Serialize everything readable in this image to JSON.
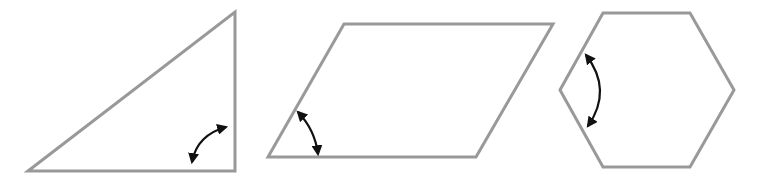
{
  "diagram": {
    "colors": {
      "shape_stroke": "#999999",
      "arrow": "#111111",
      "background": "#ffffff"
    },
    "shapes": [
      {
        "name": "right-triangle",
        "points": "28,171 235,12 235,171",
        "marked_angle": "right angle at bottom-right vertex",
        "arrow": {
          "path": "M192,162 Q197,135 226,127",
          "start": [
            192,
            162
          ],
          "end": [
            226,
            127
          ]
        }
      },
      {
        "name": "parallelogram",
        "points": "268,157 344,24 553,24 476,157",
        "marked_angle": "acute angle at bottom-left vertex",
        "arrow": {
          "path": "M298,112 Q315,130 318,154",
          "start": [
            298,
            112
          ],
          "end": [
            318,
            154
          ]
        }
      },
      {
        "name": "hexagon",
        "points": "560,90 603,13 690,13 734,90 690,167 603,167",
        "marked_angle": "interior angle at left vertex",
        "arrow": {
          "path": "M586,55 Q613,90 588,126",
          "start": [
            586,
            55
          ],
          "end": [
            588,
            126
          ]
        }
      }
    ]
  }
}
